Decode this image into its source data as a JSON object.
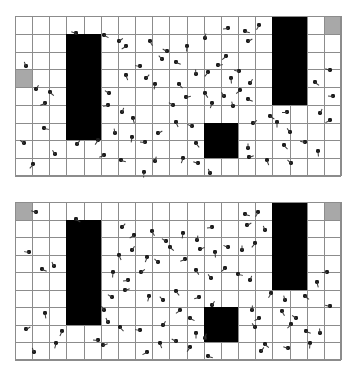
{
  "scene": {
    "title": "grid-agent-simulation-two-frames",
    "background_color": "#ffffff",
    "gridline_color": "#8c8c8c",
    "obstacle_color": "#000000",
    "shaded_cell_color": "#a8a8a8",
    "agent_color": "#1c1c1c",
    "canvas": {
      "width": 357,
      "height": 376
    }
  },
  "panels": [
    {
      "name": "panel-top",
      "label": "frame-1",
      "x": 15,
      "y": 16,
      "width": 326,
      "height": 160,
      "cols": 19,
      "rows": 9,
      "cell_w": 17.16,
      "cell_h": 17.78,
      "shaded_cells": [
        {
          "col": 0,
          "row": 3
        },
        {
          "col": 18,
          "row": 0
        }
      ],
      "obstacles": [
        {
          "name": "block-left",
          "col": 3,
          "row": 1,
          "cols": 2,
          "rows": 6
        },
        {
          "name": "block-right",
          "col": 15,
          "row": 0,
          "cols": 2,
          "rows": 5
        },
        {
          "name": "block-center",
          "col": 11,
          "row": 6,
          "cols": 2,
          "rows": 2
        }
      ],
      "agents": [
        {
          "x": 76,
          "y": 33,
          "a": 200
        },
        {
          "x": 104,
          "y": 35,
          "a": 25
        },
        {
          "x": 119,
          "y": 41,
          "a": 320
        },
        {
          "x": 126,
          "y": 46,
          "a": 150
        },
        {
          "x": 150,
          "y": 41,
          "a": 60
        },
        {
          "x": 167,
          "y": 51,
          "a": 210
        },
        {
          "x": 187,
          "y": 46,
          "a": 95
        },
        {
          "x": 205,
          "y": 38,
          "a": 280
        },
        {
          "x": 228,
          "y": 28,
          "a": 175
        },
        {
          "x": 245,
          "y": 31,
          "a": 15
        },
        {
          "x": 248,
          "y": 41,
          "a": 330
        },
        {
          "x": 259,
          "y": 25,
          "a": 120
        },
        {
          "x": 330,
          "y": 70,
          "a": 200
        },
        {
          "x": 315,
          "y": 82,
          "a": 35
        },
        {
          "x": 26,
          "y": 66,
          "a": 250
        },
        {
          "x": 36,
          "y": 89,
          "a": 300
        },
        {
          "x": 50,
          "y": 92,
          "a": 40
        },
        {
          "x": 45,
          "y": 103,
          "a": 160
        },
        {
          "x": 109,
          "y": 93,
          "a": 215
        },
        {
          "x": 126,
          "y": 75,
          "a": 70
        },
        {
          "x": 140,
          "y": 66,
          "a": 190
        },
        {
          "x": 146,
          "y": 78,
          "a": 310
        },
        {
          "x": 155,
          "y": 84,
          "a": 100
        },
        {
          "x": 162,
          "y": 59,
          "a": 230
        },
        {
          "x": 179,
          "y": 84,
          "a": 45
        },
        {
          "x": 196,
          "y": 74,
          "a": 265
        },
        {
          "x": 208,
          "y": 72,
          "a": 130
        },
        {
          "x": 218,
          "y": 65,
          "a": 350
        },
        {
          "x": 231,
          "y": 78,
          "a": 85
        },
        {
          "x": 239,
          "y": 71,
          "a": 195
        },
        {
          "x": 250,
          "y": 83,
          "a": 300
        },
        {
          "x": 205,
          "y": 93,
          "a": 55
        },
        {
          "x": 224,
          "y": 96,
          "a": 240
        },
        {
          "x": 240,
          "y": 90,
          "a": 140
        },
        {
          "x": 248,
          "y": 99,
          "a": 20
        },
        {
          "x": 108,
          "y": 105,
          "a": 170
        },
        {
          "x": 122,
          "y": 112,
          "a": 290
        },
        {
          "x": 133,
          "y": 118,
          "a": 75
        },
        {
          "x": 173,
          "y": 105,
          "a": 215
        },
        {
          "x": 186,
          "y": 97,
          "a": 345
        },
        {
          "x": 212,
          "y": 103,
          "a": 110
        },
        {
          "x": 233,
          "y": 106,
          "a": 255
        },
        {
          "x": 270,
          "y": 116,
          "a": 30
        },
        {
          "x": 287,
          "y": 112,
          "a": 180
        },
        {
          "x": 320,
          "y": 113,
          "a": 295
        },
        {
          "x": 176,
          "y": 122,
          "a": 65
        },
        {
          "x": 192,
          "y": 126,
          "a": 205
        },
        {
          "x": 253,
          "y": 123,
          "a": 320
        },
        {
          "x": 277,
          "y": 122,
          "a": 90
        },
        {
          "x": 290,
          "y": 132,
          "a": 235
        },
        {
          "x": 330,
          "y": 120,
          "a": 155
        },
        {
          "x": 44,
          "y": 128,
          "a": 10
        },
        {
          "x": 115,
          "y": 133,
          "a": 260
        },
        {
          "x": 132,
          "y": 137,
          "a": 100
        },
        {
          "x": 145,
          "y": 142,
          "a": 185
        },
        {
          "x": 158,
          "y": 133,
          "a": 330
        },
        {
          "x": 196,
          "y": 143,
          "a": 50
        },
        {
          "x": 24,
          "y": 143,
          "a": 220
        },
        {
          "x": 77,
          "y": 144,
          "a": 305
        },
        {
          "x": 98,
          "y": 140,
          "a": 125
        },
        {
          "x": 248,
          "y": 148,
          "a": 270
        },
        {
          "x": 284,
          "y": 145,
          "a": 45
        },
        {
          "x": 305,
          "y": 142,
          "a": 195
        },
        {
          "x": 318,
          "y": 151,
          "a": 85
        },
        {
          "x": 55,
          "y": 154,
          "a": 240
        },
        {
          "x": 104,
          "y": 155,
          "a": 160
        },
        {
          "x": 121,
          "y": 160,
          "a": 15
        },
        {
          "x": 155,
          "y": 161,
          "a": 285
        },
        {
          "x": 183,
          "y": 158,
          "a": 110
        },
        {
          "x": 198,
          "y": 163,
          "a": 200
        },
        {
          "x": 249,
          "y": 157,
          "a": 340
        },
        {
          "x": 267,
          "y": 160,
          "a": 70
        },
        {
          "x": 291,
          "y": 163,
          "a": 225
        },
        {
          "x": 33,
          "y": 164,
          "a": 130
        },
        {
          "x": 144,
          "y": 172,
          "a": 95
        },
        {
          "x": 210,
          "y": 173,
          "a": 250
        },
        {
          "x": 333,
          "y": 96,
          "a": 185
        },
        {
          "x": 226,
          "y": 56,
          "a": 140
        },
        {
          "x": 176,
          "y": 62,
          "a": 20
        }
      ]
    },
    {
      "name": "panel-bottom",
      "label": "frame-2",
      "x": 15,
      "y": 202,
      "width": 326,
      "height": 158,
      "cols": 19,
      "rows": 9,
      "cell_w": 17.16,
      "cell_h": 17.56,
      "shaded_cells": [
        {
          "col": 0,
          "row": 0
        },
        {
          "col": 18,
          "row": 0
        }
      ],
      "obstacles": [
        {
          "name": "block-left",
          "col": 3,
          "row": 1,
          "cols": 2,
          "rows": 6
        },
        {
          "name": "block-right",
          "col": 15,
          "row": 0,
          "cols": 2,
          "rows": 5
        },
        {
          "name": "block-center",
          "col": 11,
          "row": 6,
          "cols": 2,
          "rows": 2
        }
      ],
      "agents": [
        {
          "x": 36,
          "y": 212,
          "a": 200
        },
        {
          "x": 76,
          "y": 219,
          "a": 30
        },
        {
          "x": 122,
          "y": 227,
          "a": 310
        },
        {
          "x": 134,
          "y": 235,
          "a": 150
        },
        {
          "x": 152,
          "y": 231,
          "a": 60
        },
        {
          "x": 166,
          "y": 241,
          "a": 215
        },
        {
          "x": 183,
          "y": 233,
          "a": 100
        },
        {
          "x": 197,
          "y": 240,
          "a": 280
        },
        {
          "x": 212,
          "y": 227,
          "a": 175
        },
        {
          "x": 245,
          "y": 214,
          "a": 15
        },
        {
          "x": 247,
          "y": 225,
          "a": 330
        },
        {
          "x": 258,
          "y": 212,
          "a": 120
        },
        {
          "x": 265,
          "y": 230,
          "a": 250
        },
        {
          "x": 29,
          "y": 252,
          "a": 190
        },
        {
          "x": 119,
          "y": 255,
          "a": 65
        },
        {
          "x": 132,
          "y": 250,
          "a": 300
        },
        {
          "x": 147,
          "y": 257,
          "a": 110
        },
        {
          "x": 158,
          "y": 262,
          "a": 225
        },
        {
          "x": 170,
          "y": 247,
          "a": 40
        },
        {
          "x": 185,
          "y": 259,
          "a": 160
        },
        {
          "x": 200,
          "y": 249,
          "a": 335
        },
        {
          "x": 215,
          "y": 252,
          "a": 85
        },
        {
          "x": 228,
          "y": 247,
          "a": 205
        },
        {
          "x": 242,
          "y": 250,
          "a": 270
        },
        {
          "x": 255,
          "y": 243,
          "a": 130
        },
        {
          "x": 42,
          "y": 269,
          "a": 20
        },
        {
          "x": 54,
          "y": 266,
          "a": 245
        },
        {
          "x": 113,
          "y": 272,
          "a": 95
        },
        {
          "x": 128,
          "y": 280,
          "a": 175
        },
        {
          "x": 141,
          "y": 272,
          "a": 320
        },
        {
          "x": 196,
          "y": 270,
          "a": 55
        },
        {
          "x": 211,
          "y": 278,
          "a": 235
        },
        {
          "x": 225,
          "y": 268,
          "a": 140
        },
        {
          "x": 238,
          "y": 274,
          "a": 10
        },
        {
          "x": 250,
          "y": 280,
          "a": 290
        },
        {
          "x": 327,
          "y": 272,
          "a": 180
        },
        {
          "x": 317,
          "y": 282,
          "a": 75
        },
        {
          "x": 112,
          "y": 297,
          "a": 215
        },
        {
          "x": 125,
          "y": 290,
          "a": 340
        },
        {
          "x": 149,
          "y": 296,
          "a": 105
        },
        {
          "x": 163,
          "y": 300,
          "a": 230
        },
        {
          "x": 176,
          "y": 291,
          "a": 50
        },
        {
          "x": 199,
          "y": 297,
          "a": 165
        },
        {
          "x": 212,
          "y": 305,
          "a": 300
        },
        {
          "x": 271,
          "y": 293,
          "a": 120
        },
        {
          "x": 285,
          "y": 300,
          "a": 255
        },
        {
          "x": 305,
          "y": 296,
          "a": 35
        },
        {
          "x": 330,
          "y": 306,
          "a": 195
        },
        {
          "x": 45,
          "y": 313,
          "a": 80
        },
        {
          "x": 104,
          "y": 310,
          "a": 240
        },
        {
          "x": 180,
          "y": 310,
          "a": 145
        },
        {
          "x": 190,
          "y": 318,
          "a": 25
        },
        {
          "x": 252,
          "y": 310,
          "a": 275
        },
        {
          "x": 259,
          "y": 318,
          "a": 155
        },
        {
          "x": 282,
          "y": 311,
          "a": 60
        },
        {
          "x": 296,
          "y": 318,
          "a": 220
        },
        {
          "x": 26,
          "y": 329,
          "a": 330
        },
        {
          "x": 62,
          "y": 331,
          "a": 115
        },
        {
          "x": 108,
          "y": 322,
          "a": 245
        },
        {
          "x": 120,
          "y": 327,
          "a": 45
        },
        {
          "x": 140,
          "y": 330,
          "a": 190
        },
        {
          "x": 163,
          "y": 325,
          "a": 300
        },
        {
          "x": 196,
          "y": 333,
          "a": 90
        },
        {
          "x": 255,
          "y": 327,
          "a": 235
        },
        {
          "x": 291,
          "y": 324,
          "a": 135
        },
        {
          "x": 306,
          "y": 331,
          "a": 20
        },
        {
          "x": 320,
          "y": 333,
          "a": 265
        },
        {
          "x": 56,
          "y": 343,
          "a": 105
        },
        {
          "x": 98,
          "y": 340,
          "a": 185
        },
        {
          "x": 103,
          "y": 345,
          "a": 340
        },
        {
          "x": 160,
          "y": 343,
          "a": 70
        },
        {
          "x": 176,
          "y": 341,
          "a": 210
        },
        {
          "x": 190,
          "y": 347,
          "a": 125
        },
        {
          "x": 205,
          "y": 338,
          "a": 285
        },
        {
          "x": 265,
          "y": 344,
          "a": 40
        },
        {
          "x": 288,
          "y": 348,
          "a": 200
        },
        {
          "x": 310,
          "y": 343,
          "a": 95
        },
        {
          "x": 34,
          "y": 352,
          "a": 250
        },
        {
          "x": 147,
          "y": 352,
          "a": 155
        },
        {
          "x": 208,
          "y": 356,
          "a": 15
        },
        {
          "x": 261,
          "y": 351,
          "a": 305
        }
      ]
    }
  ]
}
